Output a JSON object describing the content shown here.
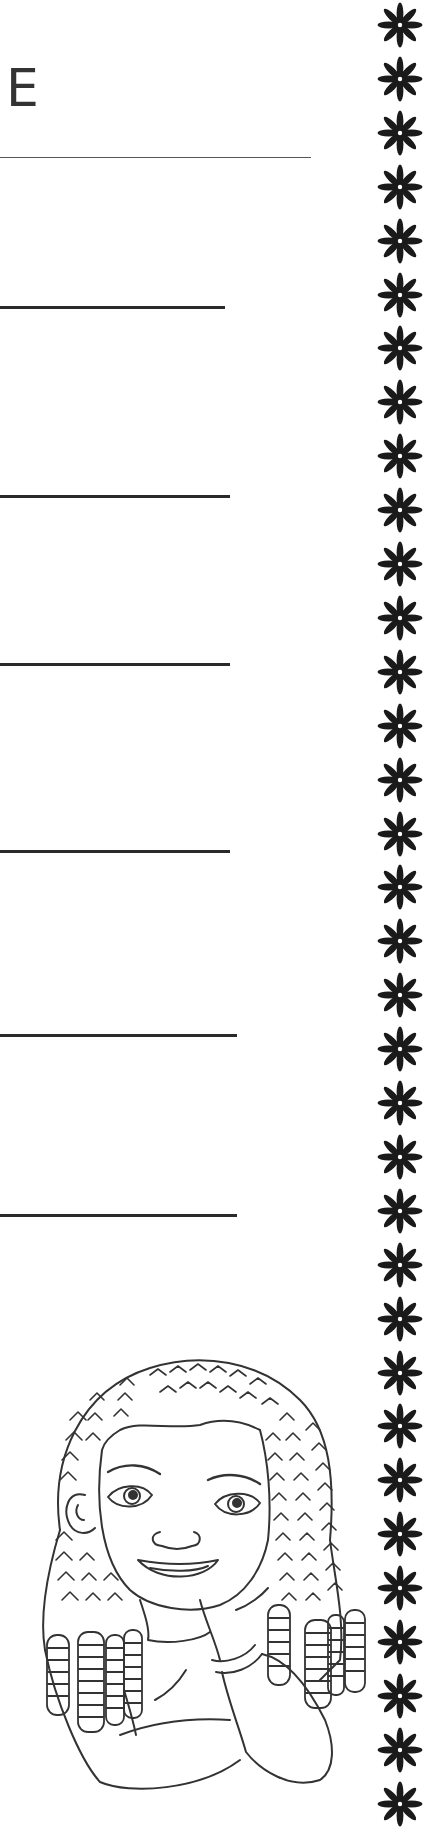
{
  "page": {
    "title_fragment": "E",
    "background": "#ffffff",
    "ink_color": "#2a2a2a"
  },
  "header_rule": {
    "y": 157,
    "x_end": 311
  },
  "writing_lines": [
    {
      "y": 306,
      "x_end": 225
    },
    {
      "y": 495,
      "x_end": 230
    },
    {
      "y": 663,
      "x_end": 230
    },
    {
      "y": 850,
      "x_end": 230
    },
    {
      "y": 1034,
      "x_end": 237
    },
    {
      "y": 1214,
      "x_end": 237
    }
  ],
  "border": {
    "icon": "eight-petal-flower-icon",
    "count": 34,
    "first_center_y": 25,
    "spacing": 53.9,
    "color": "#1a1a1a"
  },
  "illustration": {
    "subject": "girl-with-braids-coloring-outline",
    "line_color": "#333333"
  }
}
